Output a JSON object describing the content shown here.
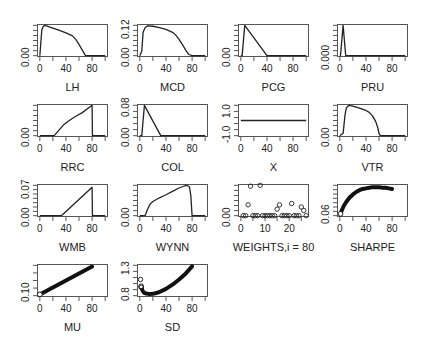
{
  "chart_data": [
    {
      "id": "LH",
      "type": "line",
      "xlabel": "LH",
      "ylabel": "",
      "xlim": [
        0,
        100
      ],
      "ylim": [
        0,
        0.13
      ],
      "xticks": [
        0,
        40,
        80
      ],
      "yticks": [
        {
          "v": 0,
          "label": "0.00"
        }
      ],
      "yminor": 6,
      "x": [
        0,
        3,
        5,
        8,
        10,
        20,
        30,
        40,
        50,
        55,
        60,
        65,
        70,
        80,
        100
      ],
      "y": [
        0,
        0.11,
        0.125,
        0.13,
        0.128,
        0.118,
        0.108,
        0.098,
        0.085,
        0.07,
        0.048,
        0.024,
        0,
        0,
        0
      ]
    },
    {
      "id": "MCD",
      "type": "line",
      "xlabel": "MCD",
      "ylabel": "",
      "xlim": [
        0,
        100
      ],
      "ylim": [
        0,
        0.13
      ],
      "xticks": [
        0,
        40,
        80
      ],
      "yticks": [
        {
          "v": 0,
          "label": "0.00"
        },
        {
          "v": 0.12,
          "label": "0.12"
        }
      ],
      "yminor": 6,
      "x": [
        0,
        3,
        5,
        8,
        12,
        20,
        30,
        40,
        50,
        55,
        60,
        65,
        70,
        75,
        80,
        100
      ],
      "y": [
        0,
        0.02,
        0.1,
        0.12,
        0.128,
        0.126,
        0.12,
        0.113,
        0.1,
        0.088,
        0.07,
        0.048,
        0.025,
        0.005,
        0,
        0
      ]
    },
    {
      "id": "PCG",
      "type": "line",
      "xlabel": "PCG",
      "ylabel": "",
      "xlim": [
        0,
        100
      ],
      "ylim": [
        0,
        0.1
      ],
      "xticks": [
        0,
        40,
        80
      ],
      "yticks": [
        {
          "v": 0,
          "label": "0.00"
        }
      ],
      "yminor": 6,
      "x": [
        0,
        2,
        6,
        40,
        100
      ],
      "y": [
        0,
        0,
        0.1,
        0,
        0
      ]
    },
    {
      "id": "PRU",
      "type": "line",
      "xlabel": "PRU",
      "ylabel": "",
      "xlim": [
        0,
        100
      ],
      "ylim": [
        0,
        0.01
      ],
      "xticks": [
        0,
        40,
        80
      ],
      "yticks": [
        {
          "v": 0,
          "label": "0.000"
        }
      ],
      "yminor": 6,
      "x": [
        0,
        1,
        5,
        9,
        100
      ],
      "y": [
        0,
        0,
        0.01,
        0,
        0
      ]
    },
    {
      "id": "RRC",
      "type": "line",
      "xlabel": "RRC",
      "ylabel": "",
      "xlim": [
        0,
        100
      ],
      "ylim": [
        0,
        0.1
      ],
      "xticks": [
        0,
        40,
        80
      ],
      "yticks": [
        {
          "v": 0,
          "label": "0.00"
        }
      ],
      "yminor": 6,
      "x": [
        0,
        22,
        30,
        36,
        45,
        55,
        65,
        80,
        80.5,
        100
      ],
      "y": [
        0,
        0,
        0.02,
        0.035,
        0.05,
        0.064,
        0.076,
        0.1,
        0,
        0
      ]
    },
    {
      "id": "COL",
      "type": "line",
      "xlabel": "COL",
      "ylabel": "",
      "xlim": [
        0,
        100
      ],
      "ylim": [
        0,
        0.08
      ],
      "xticks": [
        0,
        40,
        80
      ],
      "yticks": [
        {
          "v": 0,
          "label": "0.00"
        },
        {
          "v": 0.08,
          "label": "0.08"
        }
      ],
      "yminor": 5,
      "x": [
        0,
        3,
        7,
        32,
        100
      ],
      "y": [
        0,
        0,
        0.08,
        0,
        0
      ]
    },
    {
      "id": "X",
      "type": "line",
      "xlabel": "X",
      "ylabel": "",
      "xlim": [
        0,
        100
      ],
      "ylim": [
        -1.4,
        1.4
      ],
      "xticks": [
        0,
        40,
        80
      ],
      "yticks": [
        {
          "v": -1.0,
          "label": "-1.0"
        },
        {
          "v": 1.0,
          "label": "1.0"
        }
      ],
      "yminor": 5,
      "x": [
        0,
        100
      ],
      "y": [
        0,
        0
      ]
    },
    {
      "id": "VTR",
      "type": "line",
      "xlabel": "VTR",
      "ylabel": "",
      "xlim": [
        0,
        100
      ],
      "ylim": [
        0,
        0.13
      ],
      "xticks": [
        0,
        40,
        80
      ],
      "yticks": [
        {
          "v": 0,
          "label": "0.00"
        }
      ],
      "yminor": 6,
      "x": [
        0,
        5,
        8,
        10,
        14,
        20,
        30,
        40,
        45,
        50,
        55,
        58,
        60,
        62,
        100
      ],
      "y": [
        0,
        0.01,
        0.09,
        0.12,
        0.13,
        0.127,
        0.118,
        0.108,
        0.1,
        0.085,
        0.06,
        0.035,
        0.01,
        0,
        0
      ]
    },
    {
      "id": "WMB",
      "type": "line",
      "xlabel": "WMB",
      "ylabel": "",
      "xlim": [
        0,
        100
      ],
      "ylim": [
        0,
        0.075
      ],
      "xticks": [
        0,
        40,
        80
      ],
      "yticks": [
        {
          "v": 0,
          "label": "0.00"
        },
        {
          "v": 0.07,
          "label": "0.07"
        }
      ],
      "yminor": 7,
      "x": [
        0,
        33,
        80,
        80.5,
        100
      ],
      "y": [
        0,
        0,
        0.07,
        0,
        0
      ]
    },
    {
      "id": "WYNN",
      "type": "line",
      "xlabel": "WYNN",
      "ylabel": "",
      "xlim": [
        0,
        100
      ],
      "ylim": [
        0,
        0.09
      ],
      "xticks": [
        0,
        40,
        80
      ],
      "yticks": [
        {
          "v": 0,
          "label": "0.00"
        }
      ],
      "yminor": 6,
      "x": [
        0,
        8,
        12,
        16,
        20,
        30,
        40,
        50,
        60,
        68,
        72,
        76,
        78,
        80,
        100
      ],
      "y": [
        0,
        0,
        0.02,
        0.035,
        0.042,
        0.053,
        0.062,
        0.072,
        0.082,
        0.088,
        0.09,
        0.085,
        0.06,
        0,
        0
      ]
    },
    {
      "id": "WEIGHTS",
      "type": "scatter",
      "xlabel": "WEIGHTS,i = 80",
      "ylabel": "",
      "xlim": [
        0,
        27
      ],
      "ylim": [
        0,
        0.07
      ],
      "xticks": [
        0,
        10,
        20
      ],
      "yticks": [
        {
          "v": 0,
          "label": "0.00"
        }
      ],
      "yminor": 6,
      "x": [
        1,
        2,
        3,
        4,
        5,
        6,
        7,
        8,
        9,
        10,
        11,
        12,
        13,
        14,
        15,
        16,
        17,
        18,
        19,
        20,
        21,
        22,
        23,
        24,
        25,
        26,
        27
      ],
      "y": [
        0,
        0,
        0.025,
        0.068,
        0,
        0,
        0,
        0.07,
        0,
        0,
        0,
        0,
        0,
        0,
        0.015,
        0.025,
        0,
        0,
        0,
        0,
        0.028,
        0,
        0,
        0,
        0.02,
        0.012,
        0
      ]
    },
    {
      "id": "SHARPE",
      "type": "scatter-dense",
      "xlabel": "SHARPE",
      "ylabel": "",
      "xlim": [
        0,
        100
      ],
      "ylim": [
        0.055,
        0.105
      ],
      "xticks": [
        0,
        40,
        80
      ],
      "yticks": [
        {
          "v": 0.06,
          "label": "0.06"
        }
      ],
      "yminor": 7,
      "x": [
        1,
        3,
        6,
        10,
        15,
        20,
        25,
        30,
        35,
        40,
        45,
        50,
        55,
        60,
        65,
        70,
        75,
        80
      ],
      "y": [
        0.058,
        0.064,
        0.071,
        0.078,
        0.085,
        0.09,
        0.094,
        0.097,
        0.099,
        0.1,
        0.101,
        0.102,
        0.102,
        0.102,
        0.101,
        0.101,
        0.1,
        0.099
      ]
    },
    {
      "id": "MU",
      "type": "scatter-dense",
      "xlabel": "MU",
      "ylabel": "",
      "xlim": [
        0,
        100
      ],
      "ylim": [
        0.06,
        0.3
      ],
      "xticks": [
        0,
        40,
        80
      ],
      "yticks": [
        {
          "v": 0.1,
          "label": "0.10"
        }
      ],
      "yminor": 4,
      "x": [
        0,
        80
      ],
      "y": [
        0.07,
        0.29
      ]
    },
    {
      "id": "SD",
      "type": "scatter-dense",
      "xlabel": "SD",
      "ylabel": "",
      "xlim": [
        0,
        100
      ],
      "ylim": [
        0.74,
        1.32
      ],
      "xticks": [
        0,
        40,
        80
      ],
      "yticks": [
        {
          "v": 0.8,
          "label": "0.8"
        },
        {
          "v": 1.3,
          "label": "1.3"
        }
      ],
      "yminor": 5,
      "x": [
        2,
        4,
        6,
        10,
        15,
        20,
        25,
        30,
        40,
        50,
        60,
        70,
        80
      ],
      "y": [
        0.92,
        0.84,
        0.8,
        0.78,
        0.77,
        0.775,
        0.79,
        0.81,
        0.87,
        0.95,
        1.05,
        1.16,
        1.3
      ],
      "outliers": [
        {
          "x": 1,
          "y": 1.05
        },
        {
          "x": 2,
          "y": 0.9
        }
      ]
    }
  ],
  "layout": {
    "col_x": [
      37,
      137,
      238,
      337
    ],
    "row_y": [
      24,
      104,
      184,
      264
    ],
    "frame_w": 71,
    "frame_h": 33
  },
  "colors": {
    "line": "#222222",
    "frame": "#555555",
    "text": "#222222"
  }
}
